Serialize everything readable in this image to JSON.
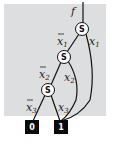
{
  "diagram": {
    "type": "binary-decision-diagram",
    "output_label": "f",
    "background_color": "#dcdedf",
    "nodes": [
      {
        "id": "s1",
        "label": "S",
        "variable": "x1"
      },
      {
        "id": "s2",
        "label": "S",
        "variable": "x2"
      },
      {
        "id": "s3",
        "label": "S",
        "variable": "x3"
      }
    ],
    "terminals": [
      {
        "id": "t0",
        "label": "0"
      },
      {
        "id": "t1",
        "label": "1"
      }
    ],
    "edges": [
      {
        "from": "s1",
        "to": "s2",
        "label": "x",
        "sub": "1",
        "negated": true
      },
      {
        "from": "s1",
        "to": "t1",
        "label": "x",
        "sub": "1",
        "negated": false
      },
      {
        "from": "s2",
        "to": "s3",
        "label": "x",
        "sub": "2",
        "negated": true
      },
      {
        "from": "s2",
        "to": "t1",
        "label": "x",
        "sub": "2",
        "negated": false
      },
      {
        "from": "s3",
        "to": "t0",
        "label": "x",
        "sub": "3",
        "negated": true
      },
      {
        "from": "s3",
        "to": "t1",
        "label": "x",
        "sub": "3",
        "negated": false
      }
    ]
  }
}
